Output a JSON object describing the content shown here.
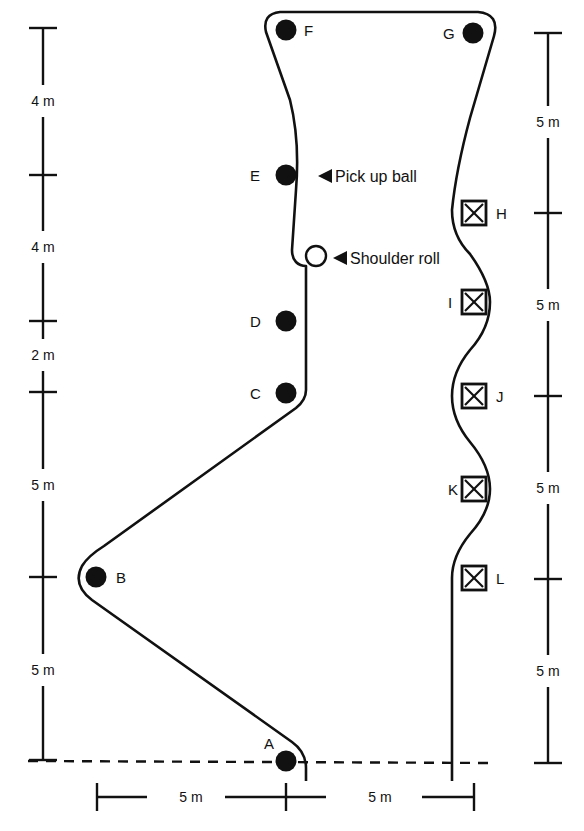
{
  "diagram": {
    "type": "obstacle-course",
    "stroke_color": "#111111",
    "background": "#ffffff",
    "cones": [
      {
        "id": "A",
        "label": "A",
        "x": 286,
        "y": 761,
        "label_dx": -22,
        "label_dy": -12
      },
      {
        "id": "B",
        "label": "B",
        "x": 96,
        "y": 577,
        "label_dx": 20,
        "label_dy": 6
      },
      {
        "id": "C",
        "label": "C",
        "x": 286,
        "y": 393,
        "label_dx": -36,
        "label_dy": 6
      },
      {
        "id": "D",
        "label": "D",
        "x": 286,
        "y": 321,
        "label_dx": -36,
        "label_dy": 6
      },
      {
        "id": "E",
        "label": "E",
        "x": 286,
        "y": 175,
        "label_dx": -36,
        "label_dy": 6
      },
      {
        "id": "F",
        "label": "F",
        "x": 286,
        "y": 30,
        "label_dx": 18,
        "label_dy": 6
      },
      {
        "id": "G",
        "label": "G",
        "x": 473,
        "y": 33,
        "label_dx": -30,
        "label_dy": 6
      }
    ],
    "boxes": [
      {
        "id": "H",
        "label": "H",
        "x": 474,
        "y": 213,
        "label_side": "right"
      },
      {
        "id": "I",
        "label": "I",
        "x": 474,
        "y": 302,
        "label_side": "left"
      },
      {
        "id": "J",
        "label": "J",
        "x": 474,
        "y": 396,
        "label_side": "right"
      },
      {
        "id": "K",
        "label": "K",
        "x": 474,
        "y": 489,
        "label_side": "left"
      },
      {
        "id": "L",
        "label": "L",
        "x": 474,
        "y": 578,
        "label_side": "right"
      }
    ],
    "annotations": [
      {
        "id": "pick-up-ball",
        "text": "Pick up ball",
        "x": 318,
        "y": 176
      },
      {
        "id": "shoulder-roll",
        "text": "Shoulder roll",
        "x": 333,
        "y": 258
      }
    ],
    "left_scale": {
      "x": 43,
      "ticks_y": [
        28,
        175,
        321,
        392,
        577,
        760
      ],
      "labels": [
        {
          "text": "4 m",
          "y": 101
        },
        {
          "text": "4 m",
          "y": 247
        },
        {
          "text": "2 m",
          "y": 355
        },
        {
          "text": "5 m",
          "y": 485
        },
        {
          "text": "5 m",
          "y": 670
        }
      ]
    },
    "right_scale": {
      "x": 548,
      "ticks_y": [
        33,
        213,
        396,
        579,
        763
      ],
      "labels": [
        {
          "text": "5 m",
          "y": 122
        },
        {
          "text": "5 m",
          "y": 305
        },
        {
          "text": "5 m",
          "y": 488
        },
        {
          "text": "5 m",
          "y": 671
        }
      ]
    },
    "bottom_scale": {
      "y": 797,
      "x_start": 97,
      "x_mid": 286,
      "x_end": 474,
      "labels": [
        {
          "text": "5 m",
          "x": 191
        },
        {
          "text": "5 m",
          "x": 380
        }
      ]
    },
    "start_line": {
      "y": 761,
      "x_start": 28,
      "x_end": 492,
      "style": "dashed"
    }
  }
}
